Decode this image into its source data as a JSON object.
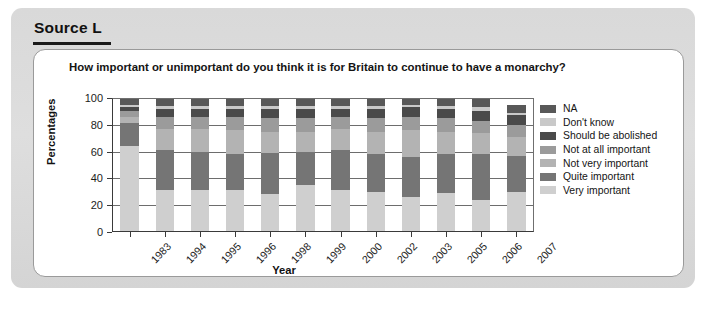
{
  "source": {
    "label": "Source L"
  },
  "chart_panel": {
    "title": "How important or unimportant do you think it is for Britain to continue to have a monarchy?"
  },
  "axes": {
    "ylabel": "Percentages",
    "xlabel": "Year",
    "yticks": [
      "0",
      "20",
      "40",
      "60",
      "80",
      "100"
    ]
  },
  "legend": {
    "items": [
      {
        "label": "NA",
        "color": "#585858"
      },
      {
        "label": "Don't know",
        "color": "#c9c9c9"
      },
      {
        "label": "Should be abolished",
        "color": "#4a4a4a"
      },
      {
        "label": "Not at all important",
        "color": "#9b9b9b"
      },
      {
        "label": "Not very important",
        "color": "#b3b3b3"
      },
      {
        "label": "Quite important",
        "color": "#757575"
      },
      {
        "label": "Very important",
        "color": "#cfcfcf"
      }
    ]
  },
  "chart_data": {
    "type": "bar",
    "subtype": "stacked-bar-percentage",
    "title": "How important or unimportant do you think it is for Britain to continue to have a monarchy?",
    "xlabel": "Year",
    "ylabel": "Percentages",
    "ylim": [
      0,
      100
    ],
    "yticks": [
      0,
      20,
      40,
      60,
      80,
      100
    ],
    "grid": true,
    "legend_position": "right",
    "categories": [
      "1983",
      "1994",
      "1995",
      "1996",
      "1998",
      "1999",
      "2000",
      "2002",
      "2003",
      "2005",
      "2006",
      "2007"
    ],
    "series": [
      {
        "name": "Very important",
        "color": "#cfcfcf",
        "values": [
          64,
          31,
          31,
          31,
          28,
          35,
          31,
          30,
          26,
          29,
          24,
          30
        ]
      },
      {
        "name": "Quite important",
        "color": "#757575",
        "values": [
          17,
          30,
          29,
          27,
          31,
          25,
          30,
          28,
          30,
          29,
          34,
          27
        ]
      },
      {
        "name": "Not very important",
        "color": "#b3b3b3",
        "values": [
          5,
          16,
          17,
          18,
          16,
          15,
          16,
          17,
          20,
          17,
          16,
          14
        ]
      },
      {
        "name": "Not at all important",
        "color": "#9b9b9b",
        "values": [
          4,
          9,
          9,
          10,
          10,
          10,
          9,
          10,
          10,
          10,
          9,
          9
        ]
      },
      {
        "name": "Should be abolished",
        "color": "#4a4a4a",
        "values": [
          3,
          6,
          6,
          6,
          7,
          7,
          6,
          7,
          7,
          7,
          7,
          7
        ]
      },
      {
        "name": "Don't know",
        "color": "#c9c9c9",
        "values": [
          2,
          2,
          2,
          2,
          2,
          2,
          2,
          2,
          2,
          2,
          3,
          2
        ]
      },
      {
        "name": "NA",
        "color": "#585858",
        "values": [
          5,
          6,
          6,
          6,
          6,
          6,
          6,
          6,
          5,
          6,
          7,
          6
        ]
      }
    ]
  },
  "caption": {
    "text": ""
  }
}
